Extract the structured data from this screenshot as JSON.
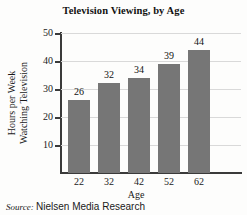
{
  "chart_data": {
    "type": "bar",
    "title": "Television Viewing, by Age",
    "xlabel": "Age",
    "ylabel_lines": [
      "Hours per Week",
      "Watching Television"
    ],
    "ylabel": "Hours per Week Watching Television",
    "categories": [
      "22",
      "32",
      "42",
      "52",
      "62"
    ],
    "values": [
      26,
      32,
      34,
      39,
      44
    ],
    "value_labels": [
      "26",
      "32",
      "34",
      "39",
      "44"
    ],
    "yticks": [
      10,
      20,
      30,
      40,
      50
    ],
    "ytick_labels": [
      "10",
      "20",
      "30",
      "40",
      "50"
    ],
    "ylim": [
      0,
      50
    ],
    "grid": "horizontal",
    "legend": "none",
    "bar_color": "#767676",
    "gridline_color": "#d9d9d9",
    "axis_color": "#3a3a3a"
  },
  "source": {
    "label": "Source:",
    "text": "Nielsen Media Research"
  }
}
